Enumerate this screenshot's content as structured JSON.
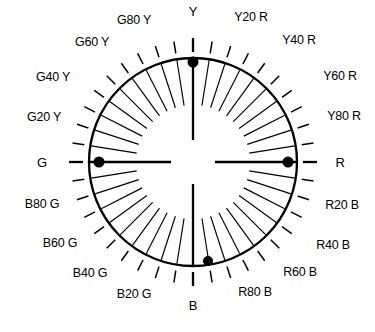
{
  "figure": {
    "name": "NCS colour circle",
    "type": "polar-hue-circle",
    "background_color": "#FFFFFF",
    "line_color": "#000000",
    "marker_color": "#000000"
  },
  "geometry": {
    "center_x": 193,
    "center_y": 162,
    "outer_radius": 104,
    "inner_tick_radius": 57,
    "outer_tick_inner_radius": 110,
    "outer_tick_outer_radius": 122,
    "radial_tick_count": 40,
    "radial_tick_step_degrees": 9,
    "axis_count": 4
  },
  "axes": [
    {
      "id": "axis-Y",
      "label": "Y",
      "angle_degrees": 90,
      "has_marker": true
    },
    {
      "id": "axis-R",
      "label": "R",
      "angle_degrees": 0,
      "has_marker": true
    },
    {
      "id": "axis-B",
      "label": "B",
      "angle_degrees": 270,
      "has_marker": true
    },
    {
      "id": "axis-G",
      "label": "G",
      "angle_degrees": 180,
      "has_marker": true
    }
  ],
  "markers": [
    {
      "id": "marker-Y",
      "on_axis": "Y",
      "x": 193,
      "y": 62,
      "radius": 5.5
    },
    {
      "id": "marker-R",
      "on_axis": "R",
      "x": 288,
      "y": 162,
      "radius": 5.5
    },
    {
      "id": "marker-G",
      "on_axis": "G",
      "x": 99,
      "y": 162,
      "radius": 5.5
    },
    {
      "id": "marker-B",
      "on_axis": "B",
      "x": 208,
      "y": 261,
      "radius": 5.0
    }
  ],
  "labels": [
    {
      "id": "label-Y",
      "text": "Y",
      "x": 193,
      "y": 11,
      "axis": true
    },
    {
      "id": "label-Y20R",
      "text": "Y20 R",
      "x": 251,
      "y": 17,
      "axis": false
    },
    {
      "id": "label-Y40R",
      "text": "Y40 R",
      "x": 299,
      "y": 40,
      "axis": false
    },
    {
      "id": "label-Y60R",
      "text": "Y60 R",
      "x": 340,
      "y": 76,
      "axis": false
    },
    {
      "id": "label-Y80R",
      "text": "Y80 R",
      "x": 344,
      "y": 116,
      "axis": false
    },
    {
      "id": "label-R",
      "text": "R",
      "x": 340,
      "y": 162,
      "axis": true
    },
    {
      "id": "label-R20B",
      "text": "R20 B",
      "x": 342,
      "y": 205,
      "axis": false
    },
    {
      "id": "label-R40B",
      "text": "R40 B",
      "x": 333,
      "y": 245,
      "axis": false
    },
    {
      "id": "label-R60B",
      "text": "R60 B",
      "x": 300,
      "y": 272,
      "axis": false
    },
    {
      "id": "label-R80B",
      "text": "R80 B",
      "x": 255,
      "y": 292,
      "axis": false
    },
    {
      "id": "label-B",
      "text": "B",
      "x": 193,
      "y": 305,
      "axis": true
    },
    {
      "id": "label-B20G",
      "text": "B20 G",
      "x": 134,
      "y": 294,
      "axis": false
    },
    {
      "id": "label-B40G",
      "text": "B40 G",
      "x": 90,
      "y": 273,
      "axis": false
    },
    {
      "id": "label-B60G",
      "text": "B60 G",
      "x": 60,
      "y": 243,
      "axis": false
    },
    {
      "id": "label-B80G",
      "text": "B80 G",
      "x": 42,
      "y": 204,
      "axis": false
    },
    {
      "id": "label-G",
      "text": "G",
      "x": 42,
      "y": 162,
      "axis": true
    },
    {
      "id": "label-G20Y",
      "text": "G20 Y",
      "x": 44,
      "y": 117,
      "axis": false
    },
    {
      "id": "label-G40Y",
      "text": "G40 Y",
      "x": 53,
      "y": 77,
      "axis": false
    },
    {
      "id": "label-G60Y",
      "text": "G60 Y",
      "x": 92,
      "y": 42,
      "axis": false
    },
    {
      "id": "label-G80Y",
      "text": "G80 Y",
      "x": 134,
      "y": 20,
      "axis": false
    }
  ]
}
